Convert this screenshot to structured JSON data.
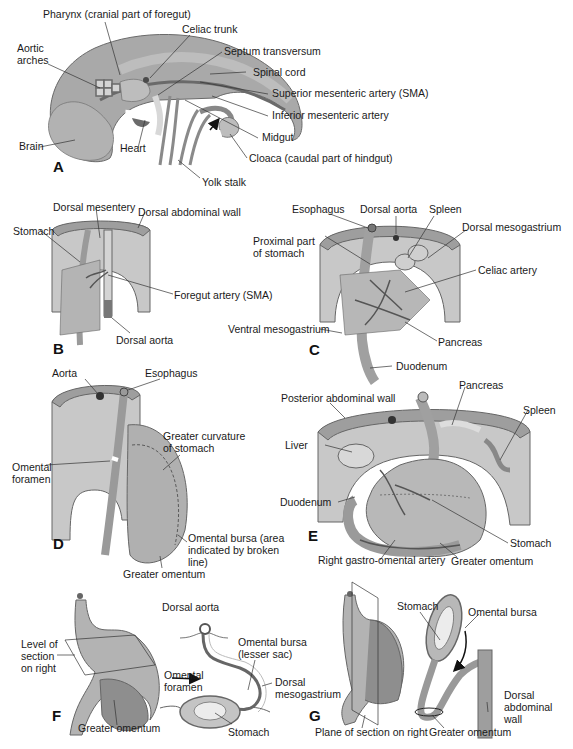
{
  "figure": {
    "colors": {
      "tissue_dark": "#8a8a8a",
      "tissue_mid": "#a9a9a9",
      "tissue_light": "#c8c8c8",
      "tissue_pale": "#dcdcdc",
      "vessel": "#5a5a5a",
      "line": "#333333",
      "background": "#ffffff"
    },
    "panels": {
      "A": {
        "letter": "A",
        "labels": {
          "pharynx": "Pharynx (cranial part of foregut)",
          "celiac_trunk": "Celiac trunk",
          "aortic_arches_1": "Aortic",
          "aortic_arches_2": "arches",
          "septum_transversum": "Septum transversum",
          "spinal_cord": "Spinal cord",
          "sma": "Superior mesenteric artery (SMA)",
          "ima": "Inferior mesenteric artery",
          "midgut": "Midgut",
          "brain": "Brain",
          "heart": "Heart",
          "cloaca": "Cloaca (caudal part of hindgut)",
          "yolk_stalk": "Yolk stalk"
        }
      },
      "B": {
        "letter": "B",
        "labels": {
          "dorsal_mesentery": "Dorsal mesentery",
          "dorsal_abdominal_wall": "Dorsal abdominal wall",
          "stomach": "Stomach",
          "foregut_artery": "Foregut artery (SMA)",
          "dorsal_aorta": "Dorsal aorta"
        }
      },
      "C": {
        "letter": "C",
        "labels": {
          "esophagus": "Esophagus",
          "dorsal_aorta": "Dorsal aorta",
          "spleen": "Spleen",
          "dorsal_mesogastrium": "Dorsal mesogastrium",
          "proximal_stomach_1": "Proximal part",
          "proximal_stomach_2": "of stomach",
          "celiac_artery": "Celiac artery",
          "ventral_mesogastrium": "Ventral mesogastrium",
          "pancreas": "Pancreas",
          "duodenum": "Duodenum"
        }
      },
      "D": {
        "letter": "D",
        "labels": {
          "aorta": "Aorta",
          "esophagus": "Esophagus",
          "greater_curvature_1": "Greater curvature",
          "greater_curvature_2": "of stomach",
          "omental_foramen_1": "Omental",
          "omental_foramen_2": "foramen",
          "omental_bursa_1": "Omental bursa (area",
          "omental_bursa_2": "indicated by broken",
          "omental_bursa_3": "line)",
          "greater_omentum": "Greater omentum"
        }
      },
      "E": {
        "letter": "E",
        "labels": {
          "posterior_abdominal_wall": "Posterior abdominal wall",
          "pancreas": "Pancreas",
          "spleen": "Spleen",
          "liver": "Liver",
          "duodenum": "Duodenum",
          "stomach": "Stomach",
          "right_gastro_omental": "Right gastro-omental artery",
          "greater_omentum": "Greater omentum"
        }
      },
      "F": {
        "letter": "F",
        "labels": {
          "level_of_section_1": "Level of",
          "level_of_section_2": "section",
          "level_of_section_3": "on right",
          "greater_omentum": "Greater omentum",
          "dorsal_aorta": "Dorsal aorta",
          "omental_bursa_1": "Omental bursa",
          "omental_bursa_2": "(lesser sac)",
          "omental_foramen_1": "Omental",
          "omental_foramen_2": "foramen",
          "dorsal_mesogastrium_1": "Dorsal",
          "dorsal_mesogastrium_2": "mesogastrium",
          "stomach": "Stomach"
        }
      },
      "G": {
        "letter": "G",
        "labels": {
          "stomach": "Stomach",
          "omental_bursa": "Omental bursa",
          "dorsal_abdominal_wall_1": "Dorsal",
          "dorsal_abdominal_wall_2": "abdominal",
          "dorsal_abdominal_wall_3": "wall",
          "plane_of_section": "Plane of section on right",
          "greater_omentum": "Greater omentum"
        }
      }
    }
  }
}
